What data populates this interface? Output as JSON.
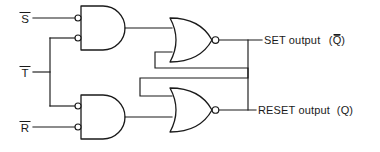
{
  "diagram": {
    "type": "logic-circuit",
    "ink_color": "#1a1a1a",
    "background_color": "#ffffff",
    "inputs": [
      {
        "id": "s",
        "label": "S",
        "overbar": true,
        "text": "S̅",
        "y": 18
      },
      {
        "id": "t",
        "label": "T",
        "overbar": true,
        "text": "T̅",
        "y": 72
      },
      {
        "id": "r",
        "label": "R",
        "overbar": true,
        "text": "R̅",
        "y": 127
      }
    ],
    "outputs": [
      {
        "id": "set",
        "text": "SET output",
        "signal": "Q̅",
        "signal_paren": "(Q̅)",
        "y": 40
      },
      {
        "id": "reset",
        "text": "RESET output",
        "signal": "Q",
        "signal_paren": "(Q)",
        "y": 110
      }
    ],
    "gates": [
      {
        "id": "and-top",
        "kind": "negative-and",
        "inputs": 2,
        "inverted_inputs": true,
        "inverted_output": false
      },
      {
        "id": "and-bottom",
        "kind": "negative-and",
        "inputs": 2,
        "inverted_inputs": true,
        "inverted_output": false
      },
      {
        "id": "nor-top",
        "kind": "nor",
        "inputs": 2,
        "inverted_inputs": false,
        "inverted_output": true
      },
      {
        "id": "nor-bottom",
        "kind": "nor",
        "inputs": 2,
        "inverted_inputs": false,
        "inverted_output": true
      }
    ]
  }
}
